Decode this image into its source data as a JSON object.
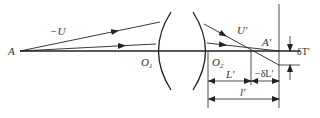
{
  "diagram": {
    "labels": {
      "object_point": "A",
      "object_angle": "−U",
      "vertex1": "O",
      "vertex1_sub": "1",
      "vertex2": "O",
      "vertex2_sub": "2",
      "image_angle": "U′",
      "image_point": "A′",
      "transverse_aberration": "δT′",
      "marginal_image_distance": "L′",
      "longitudinal_aberration": "−δL′",
      "paraxial_image_distance": "l′"
    },
    "colors": {
      "line": "#222222",
      "text": "#333333"
    }
  }
}
